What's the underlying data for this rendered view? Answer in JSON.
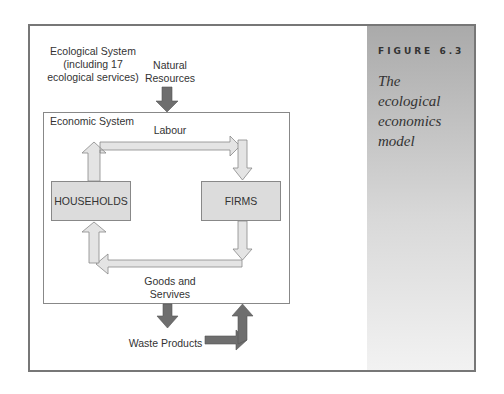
{
  "figure": {
    "label": "FIGURE 6.3",
    "title": "The ecological economics model",
    "title_lines": [
      "The",
      "ecological",
      "economics",
      "model"
    ]
  },
  "diagram": {
    "ecological_system": {
      "line1": "Ecological System",
      "line2": "(including 17",
      "line3": "ecological services)"
    },
    "natural_resources": {
      "line1": "Natural",
      "line2": "Resources"
    },
    "economic_system_label": "Economic System",
    "labour_label": "Labour",
    "households_label": "HOUSEHOLDS",
    "firms_label": "FIRMS",
    "goods_label": {
      "line1": "Goods and",
      "line2": "Servives"
    },
    "waste_label": "Waste Products"
  },
  "colors": {
    "dark_arrow": "#6e6e6e",
    "light_arrow": "#dcdcdc",
    "box_fill": "#dcdcdc",
    "border": "#777777"
  }
}
